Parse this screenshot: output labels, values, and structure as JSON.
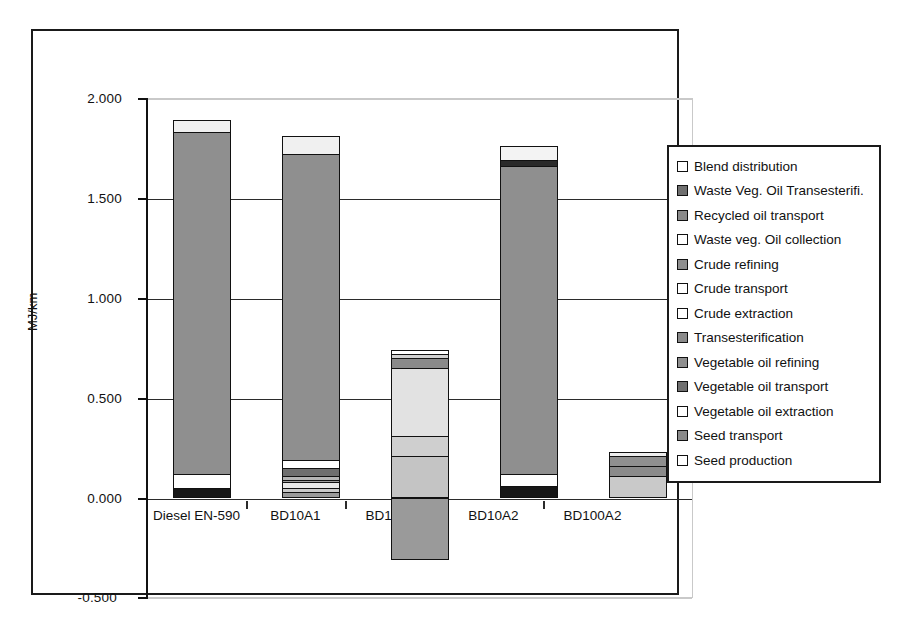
{
  "chart_data": {
    "type": "bar",
    "subtype": "stacked-bar",
    "title": "",
    "xlabel": "",
    "ylabel": "MJ/km",
    "ylim": [
      -0.5,
      2.0
    ],
    "ytick_step": 0.5,
    "ytick_labels": [
      "2.000",
      "1.500",
      "1.000",
      "0.500",
      "0.000",
      "-0.500"
    ],
    "ytick_values": [
      2.0,
      1.5,
      1.0,
      0.5,
      0.0,
      -0.5
    ],
    "grid": true,
    "legend_position": "right",
    "categories": [
      "Diesel EN-590",
      "BD10A1",
      "BD100A1",
      "BD10A2",
      "BD100A2"
    ],
    "series": [
      {
        "name": "Blend distribution",
        "color": "#ffffff",
        "values": [
          0.06,
          0.09,
          0.02,
          0.07,
          0.02
        ]
      },
      {
        "name": "Waste Veg. Oil Transesterifi.",
        "color": "#6f6f6f",
        "values": [
          0.0,
          0.0,
          0.0,
          0.0,
          0.05
        ]
      },
      {
        "name": "Recycled oil transport",
        "color": "#8a8a8a",
        "values": [
          0.0,
          0.0,
          0.0,
          0.0,
          0.05
        ]
      },
      {
        "name": "Waste veg. Oil collection",
        "color": "#d9d9d9",
        "values": [
          0.0,
          0.0,
          0.0,
          0.0,
          0.11
        ]
      },
      {
        "name": "Crude refining",
        "color": "#8f8f8f",
        "values": [
          1.71,
          1.54,
          0.0,
          1.56,
          0.0
        ]
      },
      {
        "name": "Crude transport",
        "color": "#ffffff",
        "values": [
          0.07,
          0.06,
          0.0,
          0.06,
          0.0
        ]
      },
      {
        "name": "Crude extraction",
        "color": "#171717",
        "values": [
          0.05,
          0.04,
          0.0,
          0.07,
          0.0
        ]
      },
      {
        "name": "Transesterification",
        "color": "#6f6f6f",
        "values": [
          0.0,
          0.04,
          0.06,
          0.0,
          0.0
        ]
      },
      {
        "name": "Vegetable oil refining",
        "color": "#b5b5b5",
        "values": [
          0.0,
          0.02,
          0.05,
          0.0,
          0.0
        ]
      },
      {
        "name": "Vegetable oil transport",
        "color": "#9d9d9d",
        "values": [
          0.0,
          0.01,
          0.01,
          0.0,
          0.0
        ]
      },
      {
        "name": "Vegetable oil extraction",
        "color": "#e2e2e2",
        "values": [
          0.0,
          0.03,
          0.35,
          0.0,
          0.0
        ]
      },
      {
        "name": "Seed transport",
        "color": "#b0b0b0",
        "values": [
          0.0,
          0.02,
          0.1,
          0.0,
          0.0
        ]
      },
      {
        "name": "Seed production",
        "color": "#c4c4c4",
        "values": [
          0.0,
          0.03,
          0.21,
          0.0,
          0.0
        ]
      }
    ],
    "negative_segments": [
      {
        "category": "BD100A1",
        "name": "Seed production",
        "value": -0.31,
        "color": "#9a9a9a"
      }
    ],
    "totals_positive": [
      1.89,
      1.81,
      0.74,
      1.76,
      0.23
    ]
  },
  "axes": {
    "y_title": "MJ/km",
    "y_ticks": [
      {
        "label": "2.000",
        "value": 2.0
      },
      {
        "label": "1.500",
        "value": 1.5
      },
      {
        "label": "1.000",
        "value": 1.0
      },
      {
        "label": "0.500",
        "value": 0.5
      },
      {
        "label": "0.000",
        "value": 0.0
      },
      {
        "label": "-0.500",
        "value": -0.5
      }
    ],
    "x_categories": [
      {
        "label": "Diesel EN-590"
      },
      {
        "label": "BD10A1"
      },
      {
        "label": "BD100A1"
      },
      {
        "label": "BD10A2"
      },
      {
        "label": "BD100A2"
      }
    ]
  },
  "legend": {
    "items": [
      {
        "label": "Blend distribution",
        "color": "#ffffff"
      },
      {
        "label": "Waste Veg. Oil Transesterifi.",
        "color": "#6f6f6f"
      },
      {
        "label": "Recycled oil transport",
        "color": "#8a8a8a"
      },
      {
        "label": "Waste veg. Oil collection",
        "color": "#ffffff"
      },
      {
        "label": "Crude refining",
        "color": "#8f8f8f"
      },
      {
        "label": "Crude transport",
        "color": "#ffffff"
      },
      {
        "label": "Crude extraction",
        "color": "#ffffff"
      },
      {
        "label": "Transesterification",
        "color": "#8a8a8a"
      },
      {
        "label": "Vegetable oil refining",
        "color": "#8f8f8f"
      },
      {
        "label": "Vegetable oil transport",
        "color": "#6f6f6f"
      },
      {
        "label": "Vegetable oil extraction",
        "color": "#ffffff"
      },
      {
        "label": "Seed transport",
        "color": "#8a8a8a"
      },
      {
        "label": "Seed production",
        "color": "#ffffff"
      }
    ]
  },
  "bars": [
    {
      "category": "Diesel EN-590",
      "segments": [
        {
          "name": "Crude extraction",
          "from": 0.0,
          "to": 0.05,
          "color": "#171717"
        },
        {
          "name": "Crude transport",
          "from": 0.05,
          "to": 0.12,
          "color": "#ffffff"
        },
        {
          "name": "Crude refining",
          "from": 0.12,
          "to": 1.83,
          "color": "#8f8f8f"
        },
        {
          "name": "Blend distribution",
          "from": 1.83,
          "to": 1.89,
          "color": "#f0f0f0"
        }
      ]
    },
    {
      "category": "BD10A1",
      "segments": [
        {
          "name": "Seed production",
          "from": 0.0,
          "to": 0.03,
          "color": "#9a9a9a"
        },
        {
          "name": "Seed transport",
          "from": 0.03,
          "to": 0.05,
          "color": "#c9c9c9"
        },
        {
          "name": "Vegetable oil extraction",
          "from": 0.05,
          "to": 0.08,
          "color": "#e8e8e8"
        },
        {
          "name": "Vegetable oil transport",
          "from": 0.08,
          "to": 0.09,
          "color": "#9d9d9d"
        },
        {
          "name": "Vegetable oil refining",
          "from": 0.09,
          "to": 0.11,
          "color": "#b5b5b5"
        },
        {
          "name": "Transesterification",
          "from": 0.11,
          "to": 0.15,
          "color": "#6f6f6f"
        },
        {
          "name": "Crude transport",
          "from": 0.15,
          "to": 0.19,
          "color": "#ffffff"
        },
        {
          "name": "Crude refining",
          "from": 0.19,
          "to": 1.72,
          "color": "#8f8f8f"
        },
        {
          "name": "Blend distribution",
          "from": 1.72,
          "to": 1.81,
          "color": "#f0f0f0"
        }
      ]
    },
    {
      "category": "BD100A1",
      "segments": [
        {
          "name": "Seed production",
          "from": 0.0,
          "to": 0.21,
          "color": "#c4c4c4"
        },
        {
          "name": "Seed transport",
          "from": 0.21,
          "to": 0.31,
          "color": "#cfcfcf"
        },
        {
          "name": "Vegetable oil extraction",
          "from": 0.31,
          "to": 0.65,
          "color": "#e2e2e2"
        },
        {
          "name": "Vegetable oil refining",
          "from": 0.65,
          "to": 0.7,
          "color": "#8a8a8a"
        },
        {
          "name": "Transesterification",
          "from": 0.7,
          "to": 0.72,
          "color": "#d0d0d0"
        },
        {
          "name": "Blend distribution",
          "from": 0.72,
          "to": 0.74,
          "color": "#ffffff"
        }
      ],
      "negative": [
        {
          "name": "Seed production credit",
          "from": -0.31,
          "to": 0.0,
          "color": "#9a9a9a"
        }
      ]
    },
    {
      "category": "BD10A2",
      "segments": [
        {
          "name": "Crude extraction",
          "from": 0.0,
          "to": 0.06,
          "color": "#171717"
        },
        {
          "name": "Crude transport",
          "from": 0.06,
          "to": 0.12,
          "color": "#ffffff"
        },
        {
          "name": "Crude refining",
          "from": 0.12,
          "to": 1.66,
          "color": "#8f8f8f"
        },
        {
          "name": "Waste oil band",
          "from": 1.66,
          "to": 1.69,
          "color": "#2a2a2a"
        },
        {
          "name": "Blend distribution",
          "from": 1.69,
          "to": 1.76,
          "color": "#f3f3f3"
        }
      ]
    },
    {
      "category": "BD100A2",
      "segments": [
        {
          "name": "Waste veg. Oil collection",
          "from": 0.0,
          "to": 0.11,
          "color": "#c9c9c9"
        },
        {
          "name": "Recycled oil transport",
          "from": 0.11,
          "to": 0.16,
          "color": "#8a8a8a"
        },
        {
          "name": "Waste Veg. Oil Transesterifi.",
          "from": 0.16,
          "to": 0.21,
          "color": "#8f8f8f"
        },
        {
          "name": "Blend distribution",
          "from": 0.21,
          "to": 0.23,
          "color": "#ededed"
        }
      ]
    }
  ]
}
